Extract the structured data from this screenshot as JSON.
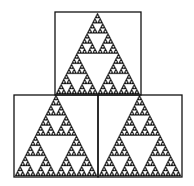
{
  "diagram": {
    "title": "",
    "background": "#ffffff",
    "stroke_color": "#111111",
    "fill_color": "#111111",
    "depth": 5,
    "panels": [
      {
        "name": "top-panel",
        "box": {
          "x": 55,
          "y": 12,
          "w": 86,
          "h": 83
        },
        "triangle": {
          "apex": [
            97.5,
            13
          ],
          "left": [
            56,
            94
          ],
          "right": [
            139.5,
            94
          ]
        }
      },
      {
        "name": "bottom-left-panel",
        "box": {
          "x": 14,
          "y": 95,
          "w": 84,
          "h": 82
        },
        "triangle": {
          "apex": [
            56,
            95
          ],
          "left": [
            15,
            176
          ],
          "right": [
            97,
            176
          ]
        }
      },
      {
        "name": "bottom-right-panel",
        "box": {
          "x": 98,
          "y": 95,
          "w": 84,
          "h": 82
        },
        "triangle": {
          "apex": [
            139.5,
            95
          ],
          "left": [
            99,
            176
          ],
          "right": [
            181,
            176
          ]
        }
      }
    ]
  }
}
